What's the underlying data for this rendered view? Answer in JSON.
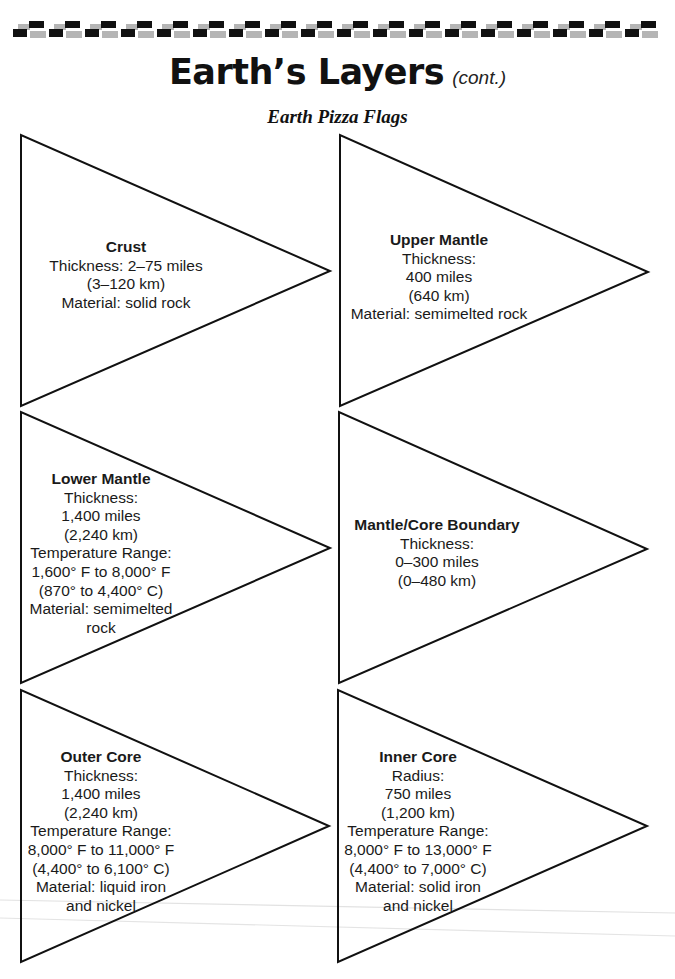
{
  "header": {
    "title": "Earth’s Layers",
    "title_suffix": "(cont.)",
    "subtitle": "Earth Pizza Flags"
  },
  "colors": {
    "line": "#111111",
    "pattern_dark": "#111111",
    "pattern_light": "#b5b5b5"
  },
  "flags": [
    {
      "name": "Crust",
      "lines": [
        "Thickness: 2–75 miles",
        "(3–120 km)",
        "Material: solid rock"
      ]
    },
    {
      "name": "Upper Mantle",
      "lines": [
        "Thickness:",
        "400 miles",
        "(640 km)",
        "Material: semimelted rock"
      ]
    },
    {
      "name": "Lower Mantle",
      "lines": [
        "Thickness:",
        "1,400 miles",
        "(2,240 km)",
        "Temperature Range:",
        "1,600° F to 8,000° F",
        "(870° to 4,400° C)",
        "Material: semimelted",
        "rock"
      ]
    },
    {
      "name": "Mantle/Core Boundary",
      "lines": [
        "Thickness:",
        "0–300 miles",
        "(0–480 km)"
      ]
    },
    {
      "name": "Outer Core",
      "lines": [
        "Thickness:",
        "1,400 miles",
        "(2,240 km)",
        "Temperature Range:",
        "8,000° F to 11,000° F",
        "(4,400° to 6,100° C)",
        "Material: liquid iron",
        "and nickel"
      ]
    },
    {
      "name": "Inner Core",
      "lines": [
        "Radius:",
        "750 miles",
        "(1,200 km)",
        "Temperature Range:",
        "8,000° F to 13,000° F",
        "(4,400° to 7,000° C)",
        "Material: solid iron",
        "and nickel"
      ]
    }
  ]
}
